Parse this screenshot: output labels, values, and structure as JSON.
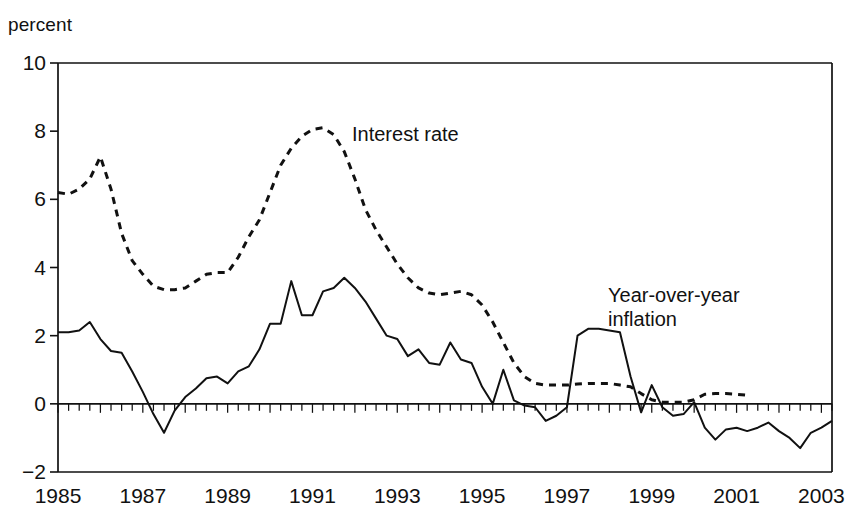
{
  "chart_data": {
    "type": "line",
    "title": "",
    "subtitle": "",
    "xlabel": "",
    "ylabel": "percent",
    "unit_label": "percent",
    "grid": false,
    "legend_position": "inline-annotations",
    "xlim": [
      1985.0,
      2003.25
    ],
    "ylim": [
      -2,
      10
    ],
    "ytick_labels": [
      "10",
      "8",
      "6",
      "4",
      "2",
      "0",
      "−2"
    ],
    "ytick_values": [
      10,
      8,
      6,
      4,
      2,
      0,
      -2
    ],
    "xtick_labels": [
      "1985",
      "1987",
      "1989",
      "1991",
      "1993",
      "1995",
      "1997",
      "1999",
      "2001",
      "2003"
    ],
    "xtick_values": [
      1985,
      1987,
      1989,
      1991,
      1993,
      1995,
      1997,
      1999,
      2001,
      2003
    ],
    "minor_xticks": "quarterly",
    "zero_line": 0,
    "series": [
      {
        "name": "Interest rate",
        "style": "dashed",
        "color": "#111111",
        "annotation": "Interest rate",
        "x": [
          1985.0,
          1985.25,
          1985.5,
          1985.75,
          1986.0,
          1986.25,
          1986.5,
          1986.75,
          1987.0,
          1987.25,
          1987.5,
          1987.75,
          1988.0,
          1988.25,
          1988.5,
          1988.75,
          1989.0,
          1989.25,
          1989.5,
          1989.75,
          1990.0,
          1990.25,
          1990.5,
          1990.75,
          1991.0,
          1991.25,
          1991.5,
          1991.75,
          1992.0,
          1992.25,
          1992.5,
          1992.75,
          1993.0,
          1993.25,
          1993.5,
          1993.75,
          1994.0,
          1994.25,
          1994.5,
          1994.75,
          1995.0,
          1995.25,
          1995.5,
          1995.75,
          1996.0,
          1996.25,
          1996.5,
          1996.75,
          1997.0,
          1997.25,
          1997.5,
          1997.75,
          1998.0,
          1998.25,
          1998.5,
          1998.75,
          1999.0,
          1999.25,
          1999.5,
          1999.75,
          2000.0,
          2000.25,
          2000.5,
          2000.75,
          2001.0,
          2001.25
        ],
        "values": [
          6.2,
          6.15,
          6.3,
          6.6,
          7.25,
          6.3,
          5.0,
          4.2,
          3.8,
          3.45,
          3.35,
          3.35,
          3.4,
          3.6,
          3.8,
          3.85,
          3.85,
          4.3,
          4.9,
          5.4,
          6.2,
          7.0,
          7.5,
          7.85,
          8.05,
          8.1,
          7.9,
          7.4,
          6.6,
          5.7,
          5.1,
          4.6,
          4.1,
          3.7,
          3.4,
          3.25,
          3.2,
          3.25,
          3.3,
          3.2,
          2.9,
          2.4,
          1.8,
          1.2,
          0.8,
          0.6,
          0.55,
          0.55,
          0.55,
          0.58,
          0.6,
          0.6,
          0.6,
          0.55,
          0.5,
          0.3,
          0.12,
          0.05,
          0.05,
          0.05,
          0.12,
          0.28,
          0.3,
          0.3,
          0.28,
          0.25
        ]
      },
      {
        "name": "Year-over-year inflation",
        "style": "solid",
        "color": "#111111",
        "annotation": "Year-over-year\ninflation",
        "x": [
          1985.0,
          1985.25,
          1985.5,
          1985.75,
          1986.0,
          1986.25,
          1986.5,
          1986.75,
          1987.0,
          1987.25,
          1987.5,
          1987.75,
          1988.0,
          1988.25,
          1988.5,
          1988.75,
          1989.0,
          1989.25,
          1989.5,
          1989.75,
          1990.0,
          1990.25,
          1990.5,
          1990.75,
          1991.0,
          1991.25,
          1991.5,
          1991.75,
          1992.0,
          1992.25,
          1992.5,
          1992.75,
          1993.0,
          1993.25,
          1993.5,
          1993.75,
          1994.0,
          1994.25,
          1994.5,
          1994.75,
          1995.0,
          1995.25,
          1995.5,
          1995.75,
          1996.0,
          1996.25,
          1996.5,
          1996.75,
          1997.0,
          1997.25,
          1997.5,
          1997.75,
          1998.0,
          1998.25,
          1998.5,
          1998.75,
          1999.0,
          1999.25,
          1999.5,
          1999.75,
          2000.0,
          2000.25,
          2000.5,
          2000.75,
          2001.0,
          2001.25,
          2001.5,
          2001.75,
          2002.0,
          2002.25,
          2002.5,
          2002.75,
          2003.0,
          2003.25
        ],
        "values": [
          2.1,
          2.1,
          2.15,
          2.4,
          1.9,
          1.55,
          1.5,
          0.95,
          0.35,
          -0.3,
          -0.85,
          -0.2,
          0.2,
          0.45,
          0.75,
          0.8,
          0.6,
          0.95,
          1.1,
          1.6,
          2.35,
          2.35,
          3.6,
          2.6,
          2.6,
          3.3,
          3.4,
          3.7,
          3.4,
          3.0,
          2.5,
          2.0,
          1.9,
          1.4,
          1.6,
          1.2,
          1.15,
          1.8,
          1.3,
          1.2,
          0.5,
          0.0,
          1.0,
          0.1,
          -0.05,
          -0.1,
          -0.5,
          -0.35,
          -0.1,
          2.0,
          2.2,
          2.2,
          2.15,
          2.1,
          0.8,
          -0.25,
          0.55,
          -0.1,
          -0.35,
          -0.3,
          0.05,
          -0.7,
          -1.05,
          -0.75,
          -0.7,
          -0.8,
          -0.7,
          -0.55,
          -0.8,
          -1.0,
          -1.3,
          -0.85,
          -0.7,
          -0.5
        ]
      }
    ]
  },
  "annotations": {
    "interest_rate": "Interest rate",
    "inflation_line1": "Year-over-year",
    "inflation_line2": "inflation"
  },
  "axes": {
    "unit": "percent"
  }
}
